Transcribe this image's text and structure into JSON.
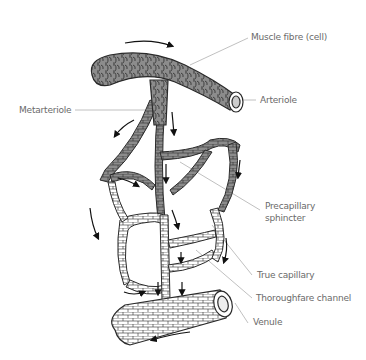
{
  "diagram": {
    "labels": {
      "muscle_fibre": "Muscle fibre (cell)",
      "arteriole": "Arteriole",
      "metarteriole": "Metarteriole",
      "precapillary_1": "Precapillary",
      "precapillary_2": "sphincter",
      "true_capillary": "True capillary",
      "thoroughfare": "Thoroughfare channel",
      "venule": "Venule"
    },
    "colors": {
      "muscle_gray": "#8c8c8c",
      "capillary_fill": "#ffffff",
      "outline": "#2a2a2a",
      "leader_line": "#b0b0b0",
      "label_text": "#6a6a6a"
    }
  }
}
